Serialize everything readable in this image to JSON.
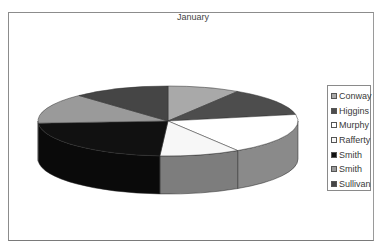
{
  "chart_data": {
    "type": "pie",
    "style": "3d-pie",
    "title": "January",
    "categories": [
      "Conway",
      "Higgins",
      "Murphy",
      "Rafferty",
      "Smith",
      "Smith",
      "Sullivan"
    ],
    "values": [
      9,
      13,
      19,
      10,
      23,
      14,
      12
    ],
    "unit": "approx. percent of total (estimated from slice angles)",
    "colors": [
      "#a9a9a9",
      "#4d4d4d",
      "#ffffff",
      "#f7f7f7",
      "#111111",
      "#9a9a9a",
      "#454545"
    ],
    "legend_position": "right"
  },
  "legend": {
    "items": [
      {
        "label": "Conway",
        "color": "#a9a9a9"
      },
      {
        "label": "Higgins",
        "color": "#4d4d4d"
      },
      {
        "label": "Murphy",
        "color": "#ffffff"
      },
      {
        "label": "Rafferty",
        "color": "#f7f7f7"
      },
      {
        "label": "Smith",
        "color": "#111111"
      },
      {
        "label": "Smith",
        "color": "#9a9a9a"
      },
      {
        "label": "Sullivan",
        "color": "#454545"
      }
    ]
  }
}
